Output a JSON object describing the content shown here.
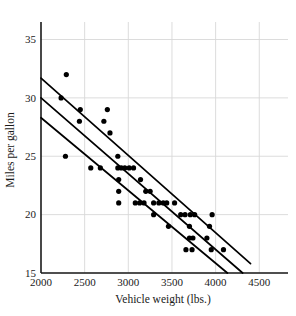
{
  "chart_data": {
    "type": "scatter",
    "title": "",
    "xlabel": "Vehicle weight (lbs.)",
    "ylabel": "Miles per gallon",
    "xlim": [
      2000,
      4600
    ],
    "ylim": [
      15,
      36.5
    ],
    "xticks": [
      2000,
      2500,
      3000,
      3500,
      4000,
      4500
    ],
    "xtick_labels": [
      "2000",
      "2500",
      "3000",
      "3500",
      "4000",
      "4500"
    ],
    "yticks": [
      15,
      20,
      25,
      30,
      35
    ],
    "ytick_labels": [
      "15",
      "20",
      "25",
      "30",
      "35"
    ],
    "grid": "both",
    "legend": "none",
    "points": [
      {
        "x": 2230,
        "y": 30
      },
      {
        "x": 2290,
        "y": 32
      },
      {
        "x": 2280,
        "y": 25
      },
      {
        "x": 2450,
        "y": 29
      },
      {
        "x": 2440,
        "y": 28
      },
      {
        "x": 2570,
        "y": 24
      },
      {
        "x": 2680,
        "y": 24
      },
      {
        "x": 2760,
        "y": 29
      },
      {
        "x": 2720,
        "y": 28
      },
      {
        "x": 2790,
        "y": 27
      },
      {
        "x": 2880,
        "y": 25
      },
      {
        "x": 2880,
        "y": 24
      },
      {
        "x": 2920,
        "y": 24
      },
      {
        "x": 2960,
        "y": 24
      },
      {
        "x": 3010,
        "y": 24
      },
      {
        "x": 3060,
        "y": 24
      },
      {
        "x": 2890,
        "y": 23
      },
      {
        "x": 2890,
        "y": 22
      },
      {
        "x": 2890,
        "y": 21
      },
      {
        "x": 3080,
        "y": 21
      },
      {
        "x": 3130,
        "y": 21
      },
      {
        "x": 3180,
        "y": 21
      },
      {
        "x": 3140,
        "y": 23
      },
      {
        "x": 3200,
        "y": 22
      },
      {
        "x": 3250,
        "y": 22
      },
      {
        "x": 3290,
        "y": 21
      },
      {
        "x": 3350,
        "y": 21
      },
      {
        "x": 3400,
        "y": 21
      },
      {
        "x": 3440,
        "y": 21
      },
      {
        "x": 3290,
        "y": 20
      },
      {
        "x": 3460,
        "y": 19
      },
      {
        "x": 3530,
        "y": 21
      },
      {
        "x": 3600,
        "y": 20
      },
      {
        "x": 3650,
        "y": 20
      },
      {
        "x": 3710,
        "y": 20
      },
      {
        "x": 3760,
        "y": 20
      },
      {
        "x": 3960,
        "y": 20
      },
      {
        "x": 3700,
        "y": 19
      },
      {
        "x": 3930,
        "y": 19
      },
      {
        "x": 3700,
        "y": 18
      },
      {
        "x": 3740,
        "y": 18
      },
      {
        "x": 3900,
        "y": 18
      },
      {
        "x": 3660,
        "y": 17
      },
      {
        "x": 3730,
        "y": 17
      },
      {
        "x": 3950,
        "y": 17
      },
      {
        "x": 4090,
        "y": 17
      }
    ],
    "fit_lines": [
      {
        "name": "upper-band",
        "x1": 2000,
        "y1": 31.7,
        "x2": 4400,
        "y2": 15.8
      },
      {
        "name": "regression-line",
        "x1": 2000,
        "y1": 30.0,
        "x2": 4310,
        "y2": 15.0
      },
      {
        "name": "lower-band",
        "x1": 2000,
        "y1": 28.3,
        "x2": 4135,
        "y2": 15.0
      }
    ]
  }
}
